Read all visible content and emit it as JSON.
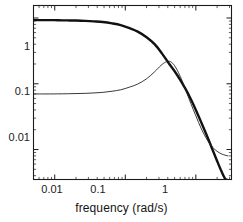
{
  "chart_data": {
    "type": "line",
    "title": "",
    "xlabel": "frequency (rad/s)",
    "ylabel": "",
    "xscale": "log",
    "yscale": "log",
    "xlim": [
      0.005,
      3.2
    ],
    "ylim": [
      0.0035,
      1.55
    ],
    "grid": false,
    "legend": null,
    "xticks": [
      0.01,
      0.1,
      1
    ],
    "xtick_labels": [
      "0.01",
      "0.1",
      "1"
    ],
    "yticks": [
      0.01,
      0.1,
      1
    ],
    "ytick_labels": [
      "0.01",
      "0.1",
      "1"
    ],
    "series": [
      {
        "name": "thick-curve",
        "style": "solid",
        "linewidth": 2.4,
        "color": "#111111",
        "x": [
          0.005,
          0.0065,
          0.0085,
          0.011,
          0.015,
          0.02,
          0.027,
          0.036,
          0.048,
          0.065,
          0.086,
          0.115,
          0.15,
          0.2,
          0.26,
          0.33,
          0.42,
          0.5,
          0.6,
          0.72,
          0.85,
          1.0,
          1.2,
          1.45,
          1.7,
          2.0,
          2.3,
          2.6,
          2.85
        ],
        "y": [
          0.93,
          0.93,
          0.93,
          0.925,
          0.92,
          0.915,
          0.905,
          0.89,
          0.87,
          0.83,
          0.78,
          0.7,
          0.62,
          0.51,
          0.4,
          0.29,
          0.2,
          0.155,
          0.115,
          0.082,
          0.058,
          0.04,
          0.0255,
          0.0158,
          0.0103,
          0.0067,
          0.0047,
          0.0036,
          0.0032
        ]
      },
      {
        "name": "thin-curve",
        "style": "solid",
        "linewidth": 0.9,
        "color": "#222222",
        "x": [
          0.005,
          0.0065,
          0.0085,
          0.011,
          0.015,
          0.02,
          0.027,
          0.036,
          0.048,
          0.065,
          0.086,
          0.115,
          0.15,
          0.2,
          0.26,
          0.32,
          0.37,
          0.41,
          0.44,
          0.47,
          0.5,
          0.55,
          0.62,
          0.72,
          0.85,
          1.0,
          1.2,
          1.45,
          1.7,
          2.0,
          2.3,
          2.6,
          2.85
        ],
        "y": [
          0.07,
          0.07,
          0.07,
          0.0702,
          0.0705,
          0.071,
          0.0715,
          0.0725,
          0.074,
          0.077,
          0.081,
          0.089,
          0.099,
          0.119,
          0.152,
          0.19,
          0.213,
          0.22,
          0.216,
          0.204,
          0.188,
          0.158,
          0.12,
          0.08,
          0.05,
          0.0325,
          0.0205,
          0.014,
          0.011,
          0.0094,
          0.0086,
          0.0082,
          0.008
        ]
      }
    ]
  },
  "axes": {
    "x_tick_values": [
      "0.01",
      "0.1",
      "1"
    ],
    "y_tick_values": [
      "1",
      "0.1",
      "0.01"
    ],
    "xaxis_title": "frequency (rad/s)"
  }
}
